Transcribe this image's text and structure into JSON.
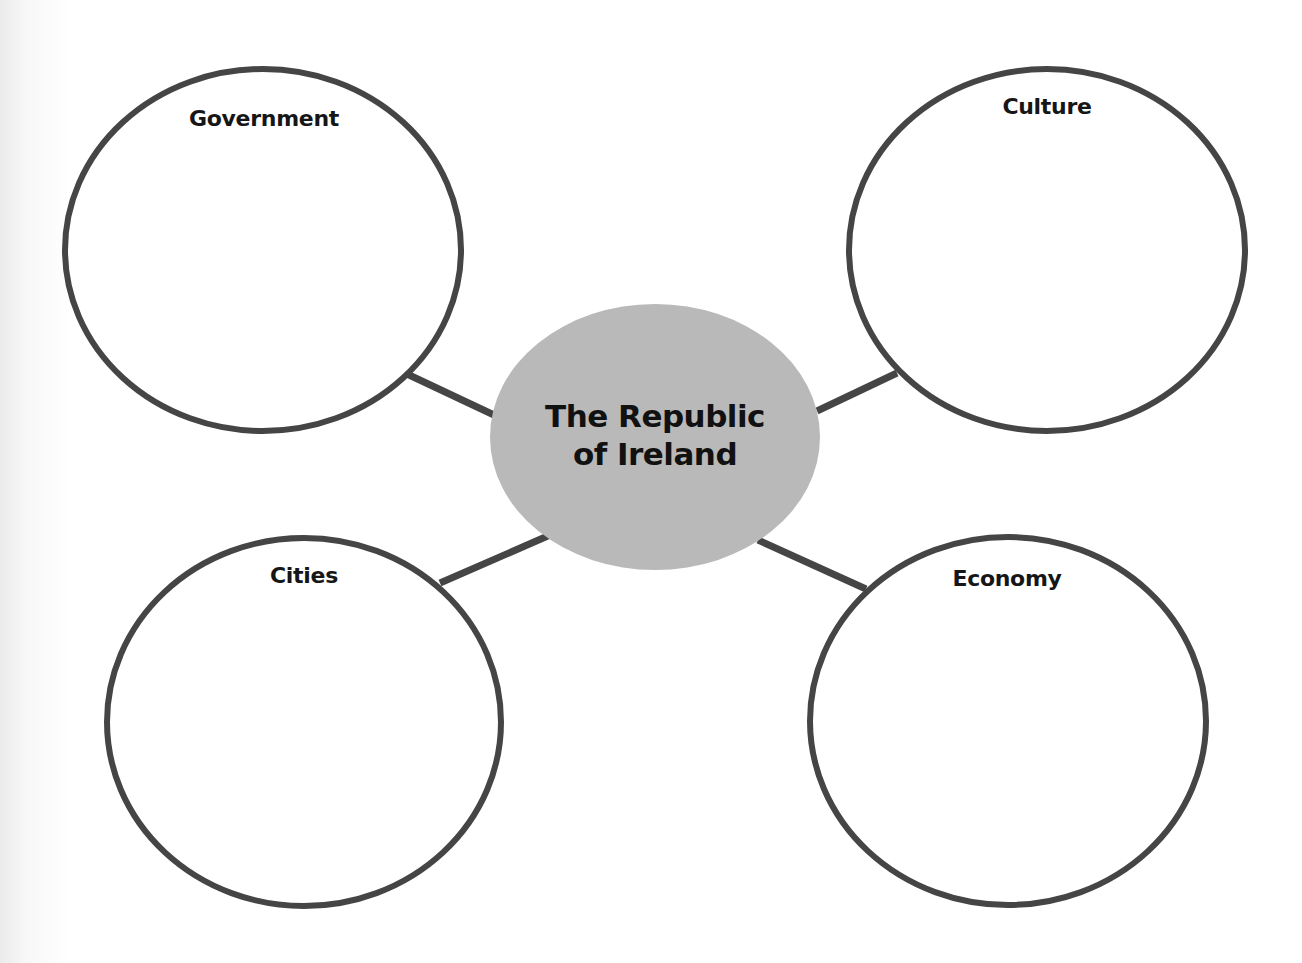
{
  "diagram": {
    "type": "concept-web",
    "center": {
      "label_line1": "The Republic",
      "label_line2": "of Ireland",
      "fill": "#b9b9b9",
      "cx": 655,
      "cy": 437,
      "rx": 165,
      "ry": 133
    },
    "nodes": [
      {
        "id": "government",
        "label": "Government",
        "cx": 263,
        "cy": 250,
        "rx": 198,
        "ry": 181,
        "label_x": 264,
        "label_y": 106,
        "connector": {
          "x1": 407,
          "y1": 374,
          "x2": 494,
          "y2": 415
        }
      },
      {
        "id": "culture",
        "label": "Culture",
        "cx": 1047,
        "cy": 250,
        "rx": 198,
        "ry": 181,
        "label_x": 1047,
        "label_y": 94,
        "connector": {
          "x1": 897,
          "y1": 373,
          "x2": 817,
          "y2": 411
        }
      },
      {
        "id": "cities",
        "label": "Cities",
        "cx": 304,
        "cy": 722,
        "rx": 197,
        "ry": 184,
        "label_x": 304,
        "label_y": 563,
        "connector": {
          "x1": 440,
          "y1": 583,
          "x2": 550,
          "y2": 535
        }
      },
      {
        "id": "economy",
        "label": "Economy",
        "cx": 1008,
        "cy": 721,
        "rx": 198,
        "ry": 184,
        "label_x": 1007,
        "label_y": 566,
        "connector": {
          "x1": 866,
          "y1": 589,
          "x2": 758,
          "y2": 540
        }
      }
    ],
    "colors": {
      "stroke": "#454545",
      "center_fill": "#b9b9b9",
      "outer_fill": "#ffffff",
      "text": "#161616"
    }
  }
}
